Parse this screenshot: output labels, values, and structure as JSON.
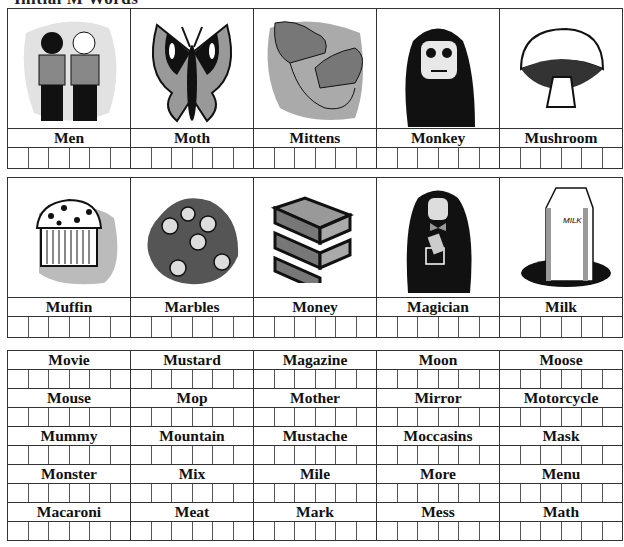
{
  "worksheet": {
    "title": "Initial M Words"
  },
  "picture_rows": [
    {
      "items": [
        {
          "label": "Men",
          "icon": "two-men-icon"
        },
        {
          "label": "Moth",
          "icon": "moth-icon"
        },
        {
          "label": "Mittens",
          "icon": "mittens-icon"
        },
        {
          "label": "Monkey",
          "icon": "monkey-icon"
        },
        {
          "label": "Mushroom",
          "icon": "mushroom-icon"
        }
      ]
    },
    {
      "items": [
        {
          "label": "Muffin",
          "icon": "muffin-icon"
        },
        {
          "label": "Marbles",
          "icon": "marbles-icon"
        },
        {
          "label": "Money",
          "icon": "money-icon"
        },
        {
          "label": "Magician",
          "icon": "magician-icon"
        },
        {
          "label": "Milk",
          "icon": "milk-carton-icon",
          "carton_text": "MILK"
        }
      ]
    }
  ],
  "word_rows": [
    [
      "Movie",
      "Mustard",
      "Magazine",
      "Moon",
      "Moose"
    ],
    [
      "Mouse",
      "Mop",
      "Mother",
      "Mirror",
      "Motorcycle"
    ],
    [
      "Mummy",
      "Mountain",
      "Mustache",
      "Moccasins",
      "Mask"
    ],
    [
      "Monster",
      "Mix",
      "Mile",
      "More",
      "Menu"
    ],
    [
      "Macaroni",
      "Meat",
      "Mark",
      "Mess",
      "Math"
    ]
  ],
  "boxes_per_cell": 6,
  "colors": {
    "border": "#333333",
    "gray_light": "#c8c8c8",
    "gray_mid": "#8a8a8a",
    "dark": "#111111"
  }
}
